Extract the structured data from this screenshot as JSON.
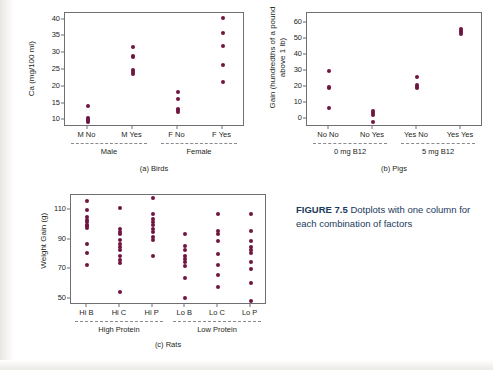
{
  "figure": {
    "number_label": "FIGURE 7.5",
    "caption_text": " Dotplots with one column for each combination of factors",
    "dot_color": "#6e1640",
    "caption_color": "#1b3a5c"
  },
  "chart_data": [
    {
      "id": "birds",
      "type": "scatter",
      "title": "(a) Birds",
      "xlabel": "",
      "ylabel": "Ca (mg/100 ml)",
      "ylim": [
        8,
        42
      ],
      "yticks": [
        10,
        15,
        20,
        25,
        30,
        35,
        40
      ],
      "grid": false,
      "categories": [
        "M No",
        "M Yes",
        "F No",
        "F Yes"
      ],
      "group_labels": [
        "Male",
        "Female"
      ],
      "group_spans": [
        [
          "M No",
          "M Yes"
        ],
        [
          "F No",
          "F Yes"
        ]
      ],
      "series": [
        {
          "name": "M No",
          "values": [
            14.2,
            10.8,
            10.4,
            9.9,
            9.6
          ]
        },
        {
          "name": "M Yes",
          "values": [
            32.0,
            29.2,
            28.8,
            25.0,
            24.4,
            23.9
          ]
        },
        {
          "name": "F No",
          "values": [
            18.4,
            16.4,
            13.4,
            13.0,
            12.6
          ]
        },
        {
          "name": "F Yes",
          "values": [
            40.5,
            36.0,
            32.2,
            26.4,
            21.5
          ]
        }
      ]
    },
    {
      "id": "pigs",
      "type": "scatter",
      "title": "(b) Pigs",
      "xlabel": "",
      "ylabel": "Gain (hundredths of a pound above 1 lb)",
      "ylim": [
        -5,
        66
      ],
      "yticks": [
        0,
        10,
        20,
        30,
        40,
        50,
        60
      ],
      "grid": false,
      "categories": [
        "No No",
        "No Yes",
        "Yes No",
        "Yes Yes"
      ],
      "group_labels": [
        "0 mg B12",
        "5 mg B12"
      ],
      "group_spans": [
        [
          "No No",
          "No Yes"
        ],
        [
          "Yes No",
          "Yes Yes"
        ]
      ],
      "series": [
        {
          "name": "No No",
          "values": [
            30.0,
            19.7,
            19.2,
            6.8
          ]
        },
        {
          "name": "No Yes",
          "values": [
            5.0,
            3.8,
            2.6,
            -1.8
          ]
        },
        {
          "name": "Yes No",
          "values": [
            26.2,
            21.0,
            20.0,
            19.0
          ]
        },
        {
          "name": "Yes Yes",
          "values": [
            56.0,
            55.0,
            54.0,
            52.8
          ]
        }
      ]
    },
    {
      "id": "rats",
      "type": "scatter",
      "title": "(c) Rats",
      "xlabel": "",
      "ylabel": "Weight Gain (g)",
      "ylim": [
        46,
        120
      ],
      "yticks": [
        50,
        70,
        90,
        110
      ],
      "grid": false,
      "categories": [
        "Hi B",
        "Hi C",
        "Hi P",
        "Lo B",
        "Lo C",
        "Lo P"
      ],
      "group_labels": [
        "High Protein",
        "Low Protein"
      ],
      "group_spans": [
        [
          "Hi B",
          "Hi C",
          "Hi P"
        ],
        [
          "Lo B",
          "Lo C",
          "Lo P"
        ]
      ],
      "series": [
        {
          "name": "Hi B",
          "values": [
            116,
            110,
            105,
            103,
            102,
            100,
            99,
            98,
            87,
            81,
            73
          ]
        },
        {
          "name": "Hi C",
          "values": [
            111,
            97,
            95,
            94,
            90,
            87,
            85,
            83,
            79,
            76,
            74,
            55
          ]
        },
        {
          "name": "Hi P",
          "values": [
            118,
            107,
            104,
            102,
            100,
            97,
            95,
            92,
            90,
            79
          ]
        },
        {
          "name": "Lo B",
          "values": [
            94,
            86,
            83,
            79,
            77,
            75,
            72,
            64,
            51
          ]
        },
        {
          "name": "Lo C",
          "values": [
            107,
            96,
            94,
            89,
            80,
            73,
            66,
            58
          ]
        },
        {
          "name": "Lo P",
          "values": [
            107,
            96,
            89,
            85,
            83,
            81,
            75,
            70,
            61,
            49
          ]
        }
      ]
    }
  ]
}
